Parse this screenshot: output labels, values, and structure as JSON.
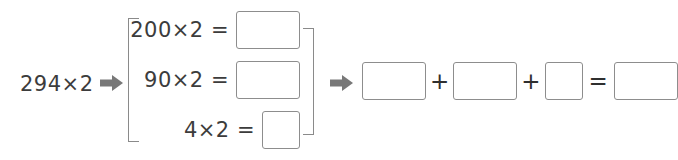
{
  "problem": {
    "left_operand": "294×2",
    "arrow_icon": "arrow-right-icon",
    "decomposition": [
      {
        "expression": "200×2 =",
        "answer": "",
        "box_shape": "wide"
      },
      {
        "expression": "90×2 =",
        "answer": "",
        "box_shape": "wide"
      },
      {
        "expression": "4×2 =",
        "answer": "",
        "box_shape": "square"
      }
    ],
    "sum_row": {
      "operators": {
        "plus": "+",
        "equals": "="
      },
      "terms": [
        {
          "answer": "",
          "box_shape": "wide"
        },
        {
          "answer": "",
          "box_shape": "wide"
        },
        {
          "answer": "",
          "box_shape": "square"
        }
      ],
      "result": {
        "answer": "",
        "box_shape": "wide"
      }
    }
  },
  "colors": {
    "background": "#ffffff",
    "text": "#3c3c3c",
    "box_border": "#8d8d8d",
    "bracket": "#8a8a8a",
    "arrow": "#777777"
  }
}
